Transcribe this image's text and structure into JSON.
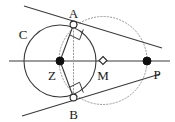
{
  "figure": {
    "width": 175,
    "height": 122,
    "background_color": "#ffffff",
    "stroke_color": "#3a3a3a",
    "dotted_color": "#9a9a9a",
    "label_color": "#1a1a1a"
  },
  "labels": {
    "circle_c": "C",
    "center_z": "Z",
    "point_a": "A",
    "point_b": "B",
    "point_m": "M",
    "point_p": "P"
  },
  "points": {
    "Z": {
      "name": "Z",
      "x": 60,
      "y": 61,
      "marker": "filled-dot",
      "label_dx": -8,
      "label_dy": 16
    },
    "A": {
      "name": "A",
      "x": 73.5,
      "y": 24.5,
      "marker": "open-circle",
      "label_dx": 0,
      "label_dy": -9
    },
    "B": {
      "name": "B",
      "x": 73.5,
      "y": 97.5,
      "marker": "open-circle",
      "label_dx": 0,
      "label_dy": 19
    },
    "M": {
      "name": "M",
      "x": 103,
      "y": 60.5,
      "marker": "open-diamond",
      "label_dx": 0,
      "label_dy": 17
    },
    "P": {
      "name": "P",
      "x": 147,
      "y": 61,
      "marker": "filled-dot",
      "label_dx": 10,
      "label_dy": 15
    }
  },
  "circles": {
    "main": {
      "name": "circle-C",
      "cx": 60,
      "cy": 61,
      "r": 36,
      "style": "solid",
      "label": "C",
      "label_x": 23,
      "label_y": 36
    },
    "thales": {
      "name": "circle-M",
      "cx": 103,
      "cy": 60.5,
      "r": 44,
      "style": "dotted"
    }
  },
  "lines": {
    "diameter": {
      "name": "horizontal-axis",
      "x1": 9,
      "y1": 61,
      "x2": 170,
      "y2": 61,
      "style": "solid"
    },
    "tangent_upper": {
      "name": "tangent-line-A",
      "x1": 24,
      "y1": 6,
      "x2": 162,
      "y2": 48,
      "style": "solid"
    },
    "tangent_lower": {
      "name": "tangent-line-B",
      "x1": 22,
      "y1": 116,
      "x2": 160,
      "y2": 74,
      "style": "solid"
    },
    "radius_ZA": {
      "name": "radius-ZA",
      "x1": 60,
      "y1": 61,
      "x2": 73.5,
      "y2": 24.5,
      "style": "solid"
    },
    "radius_ZB": {
      "name": "radius-ZB",
      "x1": 60,
      "y1": 61,
      "x2": 73.5,
      "y2": 97.5,
      "style": "solid"
    },
    "chord_AB": {
      "name": "chord-AB",
      "x1": 73.5,
      "y1": 24.5,
      "x2": 73.5,
      "y2": 97.5,
      "style": "dotted"
    }
  },
  "right_angles": [
    {
      "name": "right-angle-at-A",
      "vertex_x": 73.5,
      "vertex_y": 24.5,
      "arm1_x": 60,
      "arm1_y": 61,
      "arm2_x": 147,
      "arm2_y": 61,
      "size": 11
    },
    {
      "name": "right-angle-at-B",
      "vertex_x": 73.5,
      "vertex_y": 97.5,
      "arm1_x": 60,
      "arm1_y": 61,
      "arm2_x": 147,
      "arm2_y": 61,
      "size": 11
    }
  ]
}
